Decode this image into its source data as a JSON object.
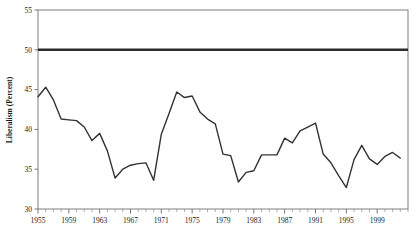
{
  "chart_data": {
    "type": "line",
    "title": "",
    "subtitle": "",
    "xlabel": "",
    "ylabel": "Liberalism (Percent)",
    "xlim": [
      1955,
      2003
    ],
    "ylim": [
      30,
      55
    ],
    "grid": false,
    "legend": "none",
    "y_ticks": [
      30,
      35,
      40,
      45,
      50,
      55
    ],
    "y_tick_labels": [
      "30",
      "35",
      "40",
      "45",
      "50",
      "55"
    ],
    "x_ticks": [
      1955,
      1959,
      1963,
      1967,
      1971,
      1975,
      1979,
      1983,
      1987,
      1991,
      1995,
      1999
    ],
    "x_tick_labels": [
      "1955",
      "1959",
      "1963",
      "1967",
      "1971",
      "1975",
      "1979",
      "1983",
      "1987",
      "1991",
      "1995",
      "1999"
    ],
    "x_minor_tick_interval": 1,
    "annotations": [
      {
        "name": "reference-line-50",
        "type": "hline",
        "value": 50,
        "color": "#2b2b2b",
        "label": ""
      }
    ],
    "series": [
      {
        "name": "Liberalism",
        "color": "#333333",
        "x": [
          1955,
          1956,
          1957,
          1958,
          1959,
          1960,
          1961,
          1962,
          1963,
          1964,
          1965,
          1966,
          1967,
          1968,
          1969,
          1970,
          1971,
          1972,
          1973,
          1974,
          1975,
          1976,
          1977,
          1978,
          1979,
          1980,
          1981,
          1982,
          1983,
          1984,
          1985,
          1986,
          1987,
          1988,
          1989,
          1990,
          1991,
          1992,
          1993,
          1994,
          1995,
          1996,
          1997,
          1998,
          1999,
          2000,
          2001,
          2002
        ],
        "values": [
          44.1,
          45.3,
          43.7,
          41.3,
          41.2,
          41.1,
          40.3,
          38.6,
          39.5,
          37.3,
          33.9,
          35.0,
          35.5,
          35.7,
          35.8,
          33.6,
          39.4,
          42.0,
          44.7,
          44.0,
          44.2,
          42.2,
          41.3,
          40.7,
          36.9,
          36.7,
          33.4,
          34.6,
          34.8,
          36.8,
          36.8,
          36.8,
          38.9,
          38.3,
          39.8,
          40.3,
          40.8,
          36.9,
          35.8,
          34.2,
          32.7,
          36.2,
          38.0,
          36.3,
          35.6,
          36.6,
          37.1,
          36.4
        ]
      }
    ]
  },
  "axis_labels": {
    "y_title": "Liberalism (Percent)"
  }
}
